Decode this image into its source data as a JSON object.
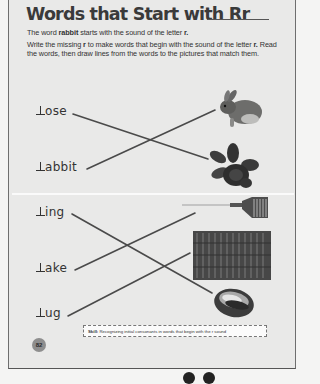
{
  "worksheet": {
    "title": "Words that Start with Rr",
    "intro_line1_pre": "The word ",
    "intro_line1_bold": "rabbit",
    "intro_line1_post": " starts with the sound of the letter ",
    "intro_line1_letter": "r.",
    "intro_line2_pre": "Write the missing ",
    "intro_line2_bold": "r",
    "intro_line2_mid": " to make words that begin with the sound of the letter ",
    "intro_line2_letter": "r.",
    "intro_line2_post": " Read the words, then draw lines from the words to the pictures that match them."
  },
  "words": [
    {
      "text": "ose",
      "full": "rose"
    },
    {
      "text": "abbit",
      "full": "rabbit"
    },
    {
      "text": "ing",
      "full": "ring"
    },
    {
      "text": "ake",
      "full": "rake"
    },
    {
      "text": "ug",
      "full": "rug"
    }
  ],
  "pictures": [
    {
      "name": "rabbit",
      "icon": "rabbit-picture"
    },
    {
      "name": "rose",
      "icon": "rose-picture"
    },
    {
      "name": "rake",
      "icon": "rake-picture"
    },
    {
      "name": "rug",
      "icon": "rug-picture"
    },
    {
      "name": "ring",
      "icon": "ring-picture"
    }
  ],
  "matches": [
    {
      "word": "rose",
      "picture": "rose"
    },
    {
      "word": "rabbit",
      "picture": "rabbit"
    },
    {
      "word": "ring",
      "picture": "ring"
    },
    {
      "word": "rake",
      "picture": "rake"
    },
    {
      "word": "rug",
      "picture": "rug"
    }
  ],
  "footer": {
    "skill_label": "Skill:",
    "skill_text": " Recognizing initial consonants in words that begin with the r sound",
    "page_number": "82"
  },
  "colors": {
    "line": "#4a4a4a",
    "page_bg": "#e9e9e8",
    "page_number_circle": "#8e8e8e"
  }
}
